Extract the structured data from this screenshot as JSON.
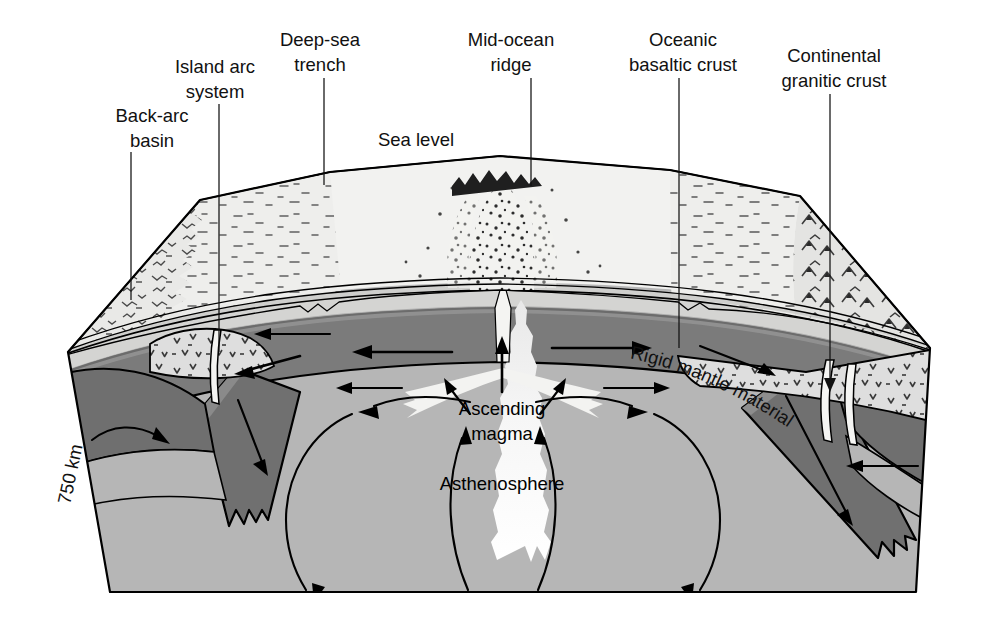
{
  "figure": {
    "type": "geological-cross-section"
  },
  "colors": {
    "background": "#ffffff",
    "ink": "#111111",
    "water": "#f2f2f0",
    "ocean_crust": "#d8d8d6",
    "continental_crust": "#dcdcda",
    "rigid_mantle": "#7b7b7b",
    "rigid_mantle_dark": "#6a6a6a",
    "asthenosphere": "#b6b6b6",
    "magma": "#f2f2f2",
    "slab": "#707070"
  },
  "callouts": [
    {
      "id": "back-arc-basin",
      "lines": [
        "Back-arc",
        "basin"
      ],
      "x": 152,
      "y": 122,
      "tip_x": 131,
      "tip_y": 300
    },
    {
      "id": "island-arc-system",
      "lines": [
        "Island arc",
        "system"
      ],
      "x": 215,
      "y": 73,
      "tip_x": 219,
      "tip_y": 352
    },
    {
      "id": "deep-sea-trench",
      "lines": [
        "Deep-sea",
        "trench"
      ],
      "x": 320,
      "y": 46,
      "tip_x": 324,
      "tip_y": 185
    },
    {
      "id": "mid-ocean-ridge",
      "lines": [
        "Mid-ocean",
        "ridge"
      ],
      "x": 511,
      "y": 46,
      "tip_x": 531,
      "tip_y": 185
    },
    {
      "id": "oceanic-basaltic-crust",
      "lines": [
        "Oceanic",
        "basaltic crust"
      ],
      "x": 683,
      "y": 46,
      "tip_x": 679,
      "tip_y": 348
    },
    {
      "id": "continental-granitic-crust",
      "lines": [
        "Continental",
        "granitic crust"
      ],
      "x": 834,
      "y": 62,
      "tip_x": 830,
      "tip_y": 385
    }
  ],
  "sea_level": {
    "label": "Sea level",
    "x": 416,
    "y": 146
  },
  "interior_labels": [
    {
      "id": "ascending-magma",
      "lines": [
        "Ascending",
        "magma"
      ],
      "x": 502,
      "y": 415
    },
    {
      "id": "asthenosphere",
      "lines": [
        "Asthenosphere"
      ],
      "x": 502,
      "y": 490
    }
  ],
  "curved_label": {
    "id": "rigid-mantle-material",
    "text": "Rigid mantle material"
  },
  "depth_scale": {
    "label": "750 km",
    "x": 70,
    "y": 505
  },
  "flow_arrows": {
    "surface_spreading": [
      "left",
      "right"
    ],
    "convection_cells": 2,
    "subduction": [
      "left-slab-down",
      "right-slab-down"
    ],
    "magma_ascent": [
      "center-up",
      "left-up",
      "right-up"
    ]
  }
}
